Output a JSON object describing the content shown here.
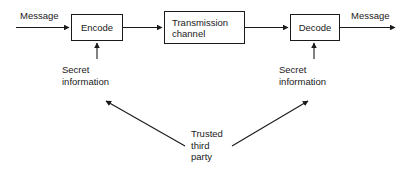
{
  "diagram": {
    "background_color": "#ffffff",
    "line_color": "#1a1a1a",
    "text_color": "#1a1a1a",
    "boxes": [
      {
        "id": "encode",
        "label": "Encode"
      },
      {
        "id": "transmission",
        "label": "Transmission\nchannel"
      },
      {
        "id": "decode",
        "label": "Decode"
      }
    ],
    "labels": {
      "message_in": "Message",
      "message_out": "Message",
      "secret_left": "Secret\ninformation",
      "secret_right": "Secret\ninformation",
      "trusted_third_party": "Trusted\nthird\nparty"
    }
  }
}
